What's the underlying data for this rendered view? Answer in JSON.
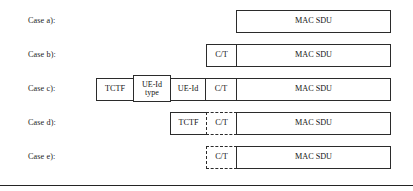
{
  "figure": {
    "bottom_rule": true,
    "rows": [
      {
        "label": "Case a):",
        "row_top": 9,
        "fields": [
          {
            "name": "mac-sdu",
            "text": "MAC SDU",
            "x": 236,
            "width": 155,
            "height": 23,
            "top": 1,
            "dashed": false,
            "tall": false
          }
        ]
      },
      {
        "label": "Case b):",
        "row_top": 43,
        "fields": [
          {
            "name": "ct",
            "text": "C/T",
            "x": 206,
            "width": 31,
            "height": 23,
            "top": 1,
            "dashed": false,
            "tall": false
          },
          {
            "name": "mac-sdu",
            "text": "MAC SDU",
            "x": 236,
            "width": 155,
            "height": 23,
            "top": 1,
            "dashed": false,
            "tall": false
          }
        ]
      },
      {
        "label": "Case c):",
        "row_top": 77,
        "fields": [
          {
            "name": "tctf",
            "text": "TCTF",
            "x": 96,
            "width": 38,
            "height": 23,
            "top": 1,
            "dashed": false,
            "tall": false
          },
          {
            "name": "ue-id-type",
            "text": "UE-Id type",
            "x": 133,
            "width": 38,
            "height": 27,
            "top": -2,
            "dashed": false,
            "tall": true
          },
          {
            "name": "ue-id",
            "text": "UE-Id",
            "x": 170,
            "width": 36,
            "height": 23,
            "top": 1,
            "dashed": false,
            "tall": false
          },
          {
            "name": "ct",
            "text": "C/T",
            "x": 205,
            "width": 32,
            "height": 23,
            "top": 1,
            "dashed": false,
            "tall": false
          },
          {
            "name": "mac-sdu",
            "text": "MAC SDU",
            "x": 236,
            "width": 155,
            "height": 23,
            "top": 1,
            "dashed": false,
            "tall": false
          }
        ]
      },
      {
        "label": "Case d):",
        "row_top": 111,
        "fields": [
          {
            "name": "tctf",
            "text": "TCTF",
            "x": 170,
            "width": 37,
            "height": 23,
            "top": 1,
            "dashed": false,
            "tall": false
          },
          {
            "name": "ct",
            "text": "C/T",
            "x": 206,
            "width": 31,
            "height": 23,
            "top": 1,
            "dashed": true,
            "tall": false
          },
          {
            "name": "mac-sdu",
            "text": "MAC SDU",
            "x": 236,
            "width": 155,
            "height": 23,
            "top": 1,
            "dashed": false,
            "tall": false
          }
        ]
      },
      {
        "label": "Case e):",
        "row_top": 145,
        "fields": [
          {
            "name": "ct",
            "text": "C/T",
            "x": 206,
            "width": 31,
            "height": 23,
            "top": 1,
            "dashed": true,
            "tall": false
          },
          {
            "name": "mac-sdu",
            "text": "MAC SDU",
            "x": 236,
            "width": 155,
            "height": 23,
            "top": 1,
            "dashed": false,
            "tall": false
          }
        ]
      }
    ]
  }
}
